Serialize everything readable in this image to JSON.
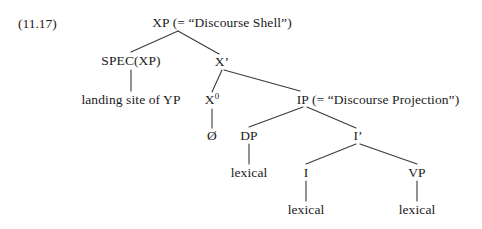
{
  "figure": {
    "example_number": "(11.17)",
    "text_color": "#1b1b1b",
    "line_color": "#3a3a3a",
    "background_color": "#ffffff"
  },
  "tree": {
    "nodes": {
      "xp": "XP (= “Discourse Shell”)",
      "spec_xp": "SPEC(XP)",
      "spec_xp_leaf": "landing site of YP",
      "x_bar": "X’",
      "x_zero_base": "X",
      "x_zero_superscript": "0",
      "x_zero_leaf": "Ø",
      "ip": "IP (= “Discourse Projection”)",
      "dp": "DP",
      "dp_leaf": "lexical",
      "i_bar": "I’",
      "i_head": "I",
      "i_head_leaf": "lexical",
      "vp": "VP",
      "vp_leaf": "lexical"
    }
  }
}
